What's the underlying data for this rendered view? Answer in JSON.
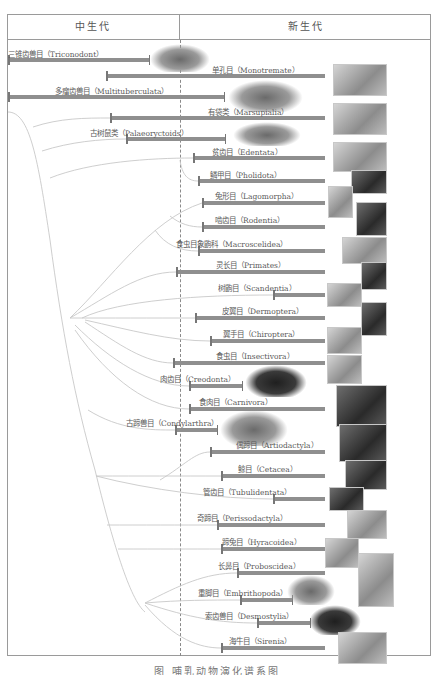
{
  "header": {
    "mesozoic": "中生代",
    "cenozoic": "新生代"
  },
  "caption": "图   哺乳动物演化谱系图",
  "colors": {
    "bar": "#8f8f8f",
    "border": "#9a9a9a",
    "branch": "#c8c8c8",
    "text": "#5a5a5a"
  },
  "orders": [
    {
      "id": "triconodont",
      "label": "三锥齿兽目（Triconodont）",
      "start": 8,
      "end": 150,
      "y": 60,
      "lx": 8,
      "ly": 48,
      "extinct": true,
      "pic": "fossil-reptile-like",
      "px": 150,
      "py": 44,
      "pw": 60,
      "ph": 28
    },
    {
      "id": "monotremata",
      "label": "单孔目（Monotremate）",
      "start": 106,
      "end": 325,
      "y": 76,
      "lx": 212,
      "ly": 64,
      "extinct": false,
      "pic": "echidna",
      "px": 333,
      "py": 64,
      "pw": 52,
      "ph": 30
    },
    {
      "id": "multituberculata",
      "label": "多瘤齿兽目（Multituberculata）",
      "start": 8,
      "end": 225,
      "y": 97,
      "lx": 55,
      "ly": 85,
      "extinct": true,
      "pic": "fossil-rodent-like",
      "px": 228,
      "py": 80,
      "pw": 75,
      "ph": 32
    },
    {
      "id": "marsupialia",
      "label": "有袋类（Marsupialia）",
      "start": 110,
      "end": 325,
      "y": 118,
      "lx": 208,
      "ly": 106,
      "extinct": false,
      "pic": "marsupial",
      "px": 333,
      "py": 103,
      "pw": 52,
      "ph": 30
    },
    {
      "id": "palaeoryctoids",
      "label": "古树鼠类（Palaeoryctoids）",
      "start": 126,
      "end": 226,
      "y": 139,
      "lx": 90,
      "ly": 127,
      "extinct": true,
      "pic": "fossil-shrew-like",
      "px": 233,
      "py": 122,
      "pw": 68,
      "ph": 24
    },
    {
      "id": "edentata",
      "label": "贫齿目（Edentata）",
      "start": 193,
      "end": 325,
      "y": 158,
      "lx": 212,
      "ly": 146,
      "extinct": false,
      "pic": "anteater",
      "px": 333,
      "py": 142,
      "pw": 52,
      "ph": 28
    },
    {
      "id": "pholidota",
      "label": "鳞甲目（Pholidota）",
      "start": 198,
      "end": 325,
      "y": 181,
      "lx": 210,
      "ly": 169,
      "extinct": false,
      "pic": "pangolin",
      "px": 351,
      "py": 170,
      "pw": 34,
      "ph": 22
    },
    {
      "id": "lagomorpha",
      "label": "兔形目（Lagomorpha）",
      "start": 202,
      "end": 325,
      "y": 203,
      "lx": 215,
      "ly": 190,
      "extinct": false,
      "pic": "rabbit",
      "px": 328,
      "py": 186,
      "pw": 23,
      "ph": 30
    },
    {
      "id": "rodentia",
      "label": "啮齿目（Rodentia）",
      "start": 202,
      "end": 325,
      "y": 227,
      "lx": 215,
      "ly": 214,
      "extinct": false,
      "pic": "rodent",
      "px": 356,
      "py": 202,
      "pw": 29,
      "ph": 32
    },
    {
      "id": "macroscelidea",
      "label": "食虫目象鼩科（Macroscelidea）",
      "start": 198,
      "end": 325,
      "y": 251,
      "lx": 176,
      "ly": 238,
      "extinct": false,
      "pic": "elephant-shrew",
      "px": 342,
      "py": 237,
      "pw": 43,
      "ph": 25
    },
    {
      "id": "primates",
      "label": "灵长目（Primates）",
      "start": 176,
      "end": 325,
      "y": 272,
      "lx": 216,
      "ly": 259,
      "extinct": false,
      "pic": "chimpanzee",
      "px": 361,
      "py": 262,
      "pw": 24,
      "ph": 26
    },
    {
      "id": "scandentia",
      "label": "树鼩目（Scandentia）",
      "start": 273,
      "end": 325,
      "y": 295,
      "lx": 218,
      "ly": 282,
      "extinct": false,
      "pic": "tree-shrew",
      "px": 327,
      "py": 283,
      "pw": 33,
      "ph": 22
    },
    {
      "id": "dermoptera",
      "label": "皮翼目（Dermoptera）",
      "start": 195,
      "end": 325,
      "y": 318,
      "lx": 222,
      "ly": 305,
      "extinct": false,
      "pic": "colugo",
      "px": 361,
      "py": 302,
      "pw": 24,
      "ph": 32
    },
    {
      "id": "chiroptera",
      "label": "翼手目（Chiroptera）",
      "start": 210,
      "end": 325,
      "y": 341,
      "lx": 223,
      "ly": 328,
      "extinct": false,
      "pic": "bat",
      "px": 327,
      "py": 327,
      "pw": 33,
      "ph": 25
    },
    {
      "id": "insectivora",
      "label": "食虫目（Insectivora）",
      "start": 173,
      "end": 325,
      "y": 363,
      "lx": 216,
      "ly": 350,
      "extinct": false,
      "pic": "hedgehog",
      "px": 327,
      "py": 355,
      "pw": 33,
      "ph": 27
    },
    {
      "id": "creodonta",
      "label": "肉齿目（Creodonta）",
      "start": 189,
      "end": 243,
      "y": 386,
      "lx": 160,
      "ly": 373,
      "extinct": true,
      "pic": "fossil-hyena-like",
      "px": 245,
      "py": 365,
      "pw": 62,
      "ph": 32
    },
    {
      "id": "carnivora",
      "label": "食肉目（Carnivora）",
      "start": 189,
      "end": 325,
      "y": 409,
      "lx": 199,
      "ly": 396,
      "extinct": false,
      "pic": "fox",
      "px": 336,
      "py": 385,
      "pw": 49,
      "ph": 40
    },
    {
      "id": "condylarthra",
      "label": "古蹄兽目（Condylarthra）",
      "start": 175,
      "end": 218,
      "y": 430,
      "lx": 126,
      "ly": 417,
      "extinct": true,
      "pic": "fossil-striped-ungulate",
      "px": 220,
      "py": 410,
      "pw": 68,
      "ph": 36
    },
    {
      "id": "artiodactyla",
      "label": "偶蹄目（Artiodactyla）",
      "start": 210,
      "end": 325,
      "y": 452,
      "lx": 236,
      "ly": 439,
      "extinct": false,
      "pic": "deer",
      "px": 339,
      "py": 424,
      "pw": 46,
      "ph": 36
    },
    {
      "id": "cetacea",
      "label": "鲸目（Cetacea）",
      "start": 221,
      "end": 325,
      "y": 476,
      "lx": 238,
      "ly": 463,
      "extinct": false,
      "pic": "whale",
      "px": 345,
      "py": 460,
      "pw": 40,
      "ph": 28
    },
    {
      "id": "tubulidentata",
      "label": "管齿目（Tubulidentata）",
      "start": 273,
      "end": 325,
      "y": 499,
      "lx": 203,
      "ly": 486,
      "extinct": false,
      "pic": "aardvark",
      "px": 329,
      "py": 487,
      "pw": 33,
      "ph": 22
    },
    {
      "id": "perissodactyla",
      "label": "奇蹄目（Perissodactyla）",
      "start": 217,
      "end": 325,
      "y": 525,
      "lx": 197,
      "ly": 512,
      "extinct": false,
      "pic": "zebra",
      "px": 347,
      "py": 510,
      "pw": 38,
      "ph": 27
    },
    {
      "id": "hyracoidea",
      "label": "蹄兔目（Hyracoidea）",
      "start": 221,
      "end": 325,
      "y": 549,
      "lx": 222,
      "ly": 536,
      "extinct": false,
      "pic": "hyrax",
      "px": 325,
      "py": 538,
      "pw": 32,
      "ph": 28
    },
    {
      "id": "proboscidea",
      "label": "长鼻目（Proboscidea）",
      "start": 237,
      "end": 325,
      "y": 573,
      "lx": 218,
      "ly": 560,
      "extinct": false,
      "pic": "elephant",
      "px": 358,
      "py": 553,
      "pw": 34,
      "ph": 52
    },
    {
      "id": "embrithopoda",
      "label": "重脚目（Embrithopoda）",
      "start": 240,
      "end": 293,
      "y": 600,
      "lx": 198,
      "ly": 587,
      "extinct": true,
      "pic": "fossil-arsinoitherium",
      "px": 287,
      "py": 575,
      "pw": 48,
      "ph": 30
    },
    {
      "id": "desmostylia",
      "label": "索齿兽目（Desmostylia）",
      "start": 257,
      "end": 311,
      "y": 623,
      "lx": 205,
      "ly": 610,
      "extinct": true,
      "pic": "fossil-desmostylus",
      "px": 309,
      "py": 605,
      "pw": 52,
      "ph": 30
    },
    {
      "id": "sirenia",
      "label": "海牛目（Sirenia）",
      "start": 221,
      "end": 325,
      "y": 648,
      "lx": 229,
      "ly": 635,
      "extinct": false,
      "pic": "manatee",
      "px": 338,
      "py": 632,
      "pw": 47,
      "ph": 30
    }
  ]
}
